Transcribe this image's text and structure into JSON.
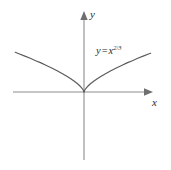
{
  "figure": {
    "background_color": "#ffffff",
    "axis_color": "#8c8c8c",
    "curve_color": "#5a5a5a",
    "text_color": "#2b2b2b"
  },
  "labels": {
    "y_axis": "y",
    "x_axis": "x",
    "equation": {
      "lhs": "y",
      "operator": "=",
      "base": "x",
      "exponent_numerator": "2",
      "exponent_slash": "/",
      "exponent_denominator": "3",
      "full_text": "y = x^(2/3)"
    }
  },
  "chart_data": {
    "type": "line",
    "title": "",
    "subtitle": "",
    "xlabel": "x",
    "ylabel": "y",
    "equation": "y = x^(2/3)",
    "grid": false,
    "legend": null,
    "annotations": [
      {
        "text": "y = x^(2/3)",
        "x": 1.4,
        "y": 2.1
      }
    ],
    "axes": {
      "x_arrow": true,
      "y_arrow": true,
      "origin_marked": false,
      "ticks": [],
      "tick_labels": []
    },
    "xlim": [
      -3.4,
      3.2
    ],
    "ylim": [
      -3.8,
      2.9
    ],
    "series": [
      {
        "name": "y = x^(2/3)",
        "x": [
          -3.2,
          -3.0,
          -2.75,
          -2.5,
          -2.25,
          -2.0,
          -1.75,
          -1.5,
          -1.25,
          -1.0,
          -0.8,
          -0.6,
          -0.45,
          -0.3,
          -0.2,
          -0.12,
          -0.06,
          -0.02,
          0.0,
          0.02,
          0.06,
          0.12,
          0.2,
          0.3,
          0.45,
          0.6,
          0.8,
          1.0,
          1.25,
          1.5,
          1.75,
          2.0,
          2.25,
          2.5,
          2.75,
          3.0,
          3.1
        ],
        "y": [
          2.17,
          2.08,
          1.96,
          1.84,
          1.71,
          1.59,
          1.45,
          1.31,
          1.16,
          1.0,
          0.862,
          0.711,
          0.588,
          0.448,
          0.342,
          0.244,
          0.153,
          0.074,
          0.0,
          0.074,
          0.153,
          0.244,
          0.342,
          0.448,
          0.588,
          0.711,
          0.862,
          1.0,
          1.16,
          1.31,
          1.45,
          1.59,
          1.71,
          1.84,
          1.96,
          2.08,
          2.12
        ]
      }
    ]
  }
}
